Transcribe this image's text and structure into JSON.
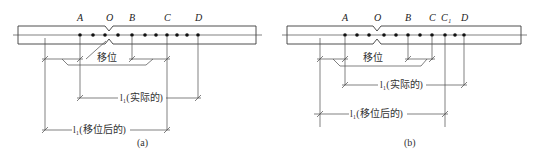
{
  "figures": [
    {
      "id": "a",
      "caption": "(a)",
      "labels": {
        "A": "A",
        "O": "O",
        "B": "B",
        "C": "C",
        "D": "D"
      },
      "shift_label": "移位",
      "dim_actual": "l₁(实际的)",
      "dim_shifted": "l₁(移位后的)"
    },
    {
      "id": "b",
      "caption": "(b)",
      "labels": {
        "A": "A",
        "O": "O",
        "B": "B",
        "C": "C",
        "C1": "C₁",
        "D": "D"
      },
      "shift_label": "移位",
      "dim_actual": "l₁(实际的)",
      "dim_shifted": "l₁(移位后的)"
    }
  ],
  "colors": {
    "line": "#3a3a3a",
    "dot": "#111111",
    "text": "#333333"
  }
}
